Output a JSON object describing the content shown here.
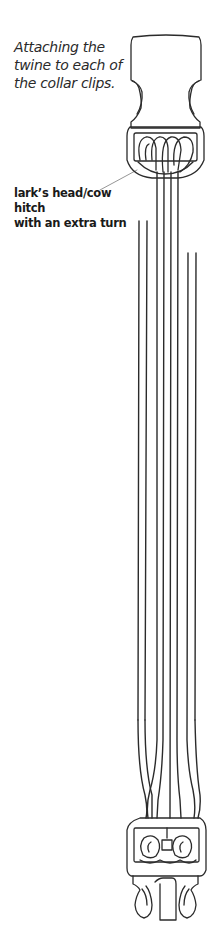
{
  "figure": {
    "caption_lines": [
      "Attaching the",
      "twine to each of",
      "the collar clips."
    ],
    "callout": {
      "lines": [
        "lark’s head/cow hitch",
        "with an extra turn"
      ]
    }
  },
  "colors": {
    "line": "#2b2b2b",
    "leader": "#8a8a8a",
    "background": "#ffffff"
  }
}
